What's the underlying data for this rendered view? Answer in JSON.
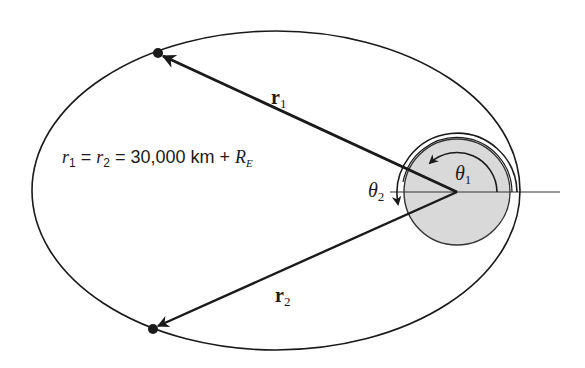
{
  "diagram": {
    "title": "",
    "colors": {
      "background": "#ffffff",
      "stroke": "#1a1a1a",
      "earth_fill": "#d9d9d9"
    },
    "orbit": {
      "cx": 276,
      "cy": 190.5,
      "rx": 244,
      "ry": 159.5
    },
    "earth": {
      "cx": 457,
      "cy": 192,
      "r": 53
    },
    "reference_line": {
      "x1": 457,
      "y1": 192,
      "x2": 560,
      "y2": 192
    },
    "satellites": [
      {
        "id": "sat1",
        "x": 158,
        "y": 53
      },
      {
        "id": "sat2",
        "x": 153,
        "y": 329
      }
    ],
    "vectors": [
      {
        "id": "r1",
        "label_main": "r",
        "label_sub": "1"
      },
      {
        "id": "r2",
        "label_main": "r",
        "label_sub": "2"
      }
    ],
    "angles": [
      {
        "id": "theta1",
        "label_main": "θ",
        "label_sub": "1"
      },
      {
        "id": "theta2",
        "label_main": "θ",
        "label_sub": "2"
      }
    ],
    "equation": {
      "r1_main": "r",
      "r1_sub": "1",
      "eq1": " = ",
      "r2_main": "r",
      "r2_sub": "2",
      "eq2": " = 30,000 km + ",
      "re_main": "R",
      "re_sub": "E"
    }
  }
}
